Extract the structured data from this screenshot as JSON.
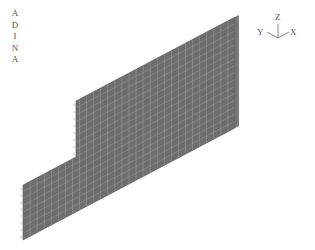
{
  "logo": {
    "letters": [
      "A",
      "D",
      "I",
      "N",
      "A"
    ]
  },
  "axes_triad": {
    "z_label": "Z",
    "y_label": "Y",
    "x_label": "X"
  },
  "model": {
    "description": "Stepped wall finite element mesh, isometric view",
    "fill_color": "#6e6e6e",
    "side_color": "#8a8a8a",
    "mesh_line_color": "#b4b4b4",
    "boundary_marker_color": "#c8c8c8"
  }
}
